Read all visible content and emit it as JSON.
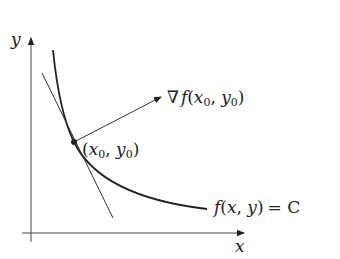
{
  "diagram": {
    "axes": {
      "x_label": "x",
      "y_label": "y"
    },
    "curve_label": {
      "func": "f",
      "args": "(x, y)",
      "equals": "= C"
    },
    "gradient_label": {
      "nabla": "∇",
      "func": "f",
      "open": "(",
      "x0": "x",
      "x0_sub": "0",
      "sep": ", ",
      "y0": "y",
      "y0_sub": "0",
      "close": ")"
    },
    "point_label": {
      "open": "(",
      "x0": "x",
      "x0_sub": "0",
      "sep": ", ",
      "y0": "y",
      "y0_sub": "0",
      "close": ")"
    },
    "colors": {
      "ink": "#222222",
      "axis": "#444444"
    }
  }
}
